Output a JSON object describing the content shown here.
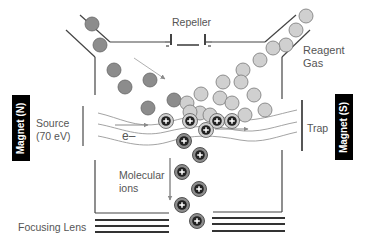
{
  "labels": {
    "repeller": "Repeller",
    "reagent_gas_line1": "Reagent",
    "reagent_gas_line2": "Gas",
    "source_line1": "Source",
    "source_line2": "(70 eV)",
    "electron": "e–",
    "trap": "Trap",
    "molecular_ions_line1": "Molecular",
    "molecular_ions_line2": "ions",
    "focusing_lens": "Focusing Lens",
    "magnet_north": "Magnet (N)",
    "magnet_south": "Magnet (S)"
  },
  "colors": {
    "line": "#444444",
    "arrow": "#999999",
    "analyte_molecule": "#8c8c8c",
    "reagent_molecule": "#d0d0d0",
    "ion_inner": "#222222",
    "magnet_bg": "#000000",
    "label_text": "#555555"
  },
  "particles": {
    "analyte": [
      [
        92,
        24
      ],
      [
        100,
        45
      ],
      [
        114,
        70
      ],
      [
        125,
        87
      ],
      [
        150,
        80
      ],
      [
        148,
        108
      ],
      [
        174,
        100
      ]
    ],
    "reagent": [
      [
        306,
        16
      ],
      [
        296,
        30
      ],
      [
        286,
        45
      ],
      [
        273,
        48
      ],
      [
        260,
        60
      ],
      [
        243,
        70
      ],
      [
        223,
        82
      ],
      [
        241,
        82
      ],
      [
        220,
        98
      ],
      [
        200,
        113
      ],
      [
        254,
        95
      ],
      [
        232,
        103
      ],
      [
        201,
        94
      ],
      [
        187,
        103
      ],
      [
        265,
        110
      ],
      [
        210,
        115
      ],
      [
        190,
        112
      ],
      [
        245,
        115
      ]
    ],
    "ions_light": [
      [
        166,
        121
      ],
      [
        190,
        121
      ],
      [
        217,
        121
      ],
      [
        206,
        130
      ],
      [
        232,
        121
      ]
    ],
    "ions_dark": [
      [
        184,
        141
      ],
      [
        200,
        155
      ],
      [
        182,
        172
      ],
      [
        199,
        189
      ],
      [
        182,
        205
      ],
      [
        197,
        221
      ]
    ]
  }
}
